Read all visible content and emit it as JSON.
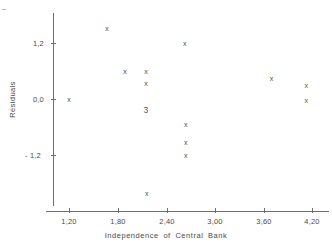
{
  "chart_data": {
    "type": "scatter",
    "title": "",
    "xlabel": "Independence of Central Bank",
    "ylabel": "Residuals",
    "xlim": [
      1.02,
      4.33
    ],
    "ylim": [
      -2.35,
      1.7
    ],
    "grid": false,
    "legend": null,
    "xticks": [
      1.2,
      1.8,
      2.4,
      3.0,
      3.6,
      4.2
    ],
    "xtick_labels": [
      "1,20",
      "1,80",
      "2,40",
      "3,00",
      "3,60",
      "4,20"
    ],
    "yticks": [
      1.2,
      0.0,
      -1.2
    ],
    "ytick_labels": [
      "1,2",
      "0,0",
      "- 1,2"
    ],
    "marker_symbol": "x",
    "decimal_separator": ",",
    "points": [
      {
        "x": 1.2,
        "y": 0.0,
        "label": "x"
      },
      {
        "x": 1.67,
        "y": 1.52,
        "label": "x"
      },
      {
        "x": 1.89,
        "y": 0.58,
        "label": "x"
      },
      {
        "x": 2.15,
        "y": 0.58,
        "label": "x"
      },
      {
        "x": 2.15,
        "y": 0.34,
        "label": "x"
      },
      {
        "x": 2.15,
        "y": -0.24,
        "label": "3",
        "overplot_count": 3
      },
      {
        "x": 2.63,
        "y": 1.18,
        "label": "x"
      },
      {
        "x": 2.64,
        "y": -0.55,
        "label": "x"
      },
      {
        "x": 2.64,
        "y": -0.94,
        "label": "x"
      },
      {
        "x": 2.64,
        "y": -1.2,
        "label": "x"
      },
      {
        "x": 2.16,
        "y": -2.02,
        "label": "x"
      },
      {
        "x": 3.7,
        "y": 0.43,
        "label": "x"
      },
      {
        "x": 4.13,
        "y": 0.3,
        "label": "x"
      },
      {
        "x": 4.13,
        "y": -0.04,
        "label": "x"
      }
    ],
    "annotations": [
      {
        "text": "3",
        "x": 2.15,
        "y": -0.24,
        "meaning": "three-coincident-points"
      }
    ],
    "colors": {
      "axis": "#6e6e6e",
      "marker": "#4f4f4f",
      "text": "#4a4a4a",
      "background": "#ffffff"
    }
  }
}
